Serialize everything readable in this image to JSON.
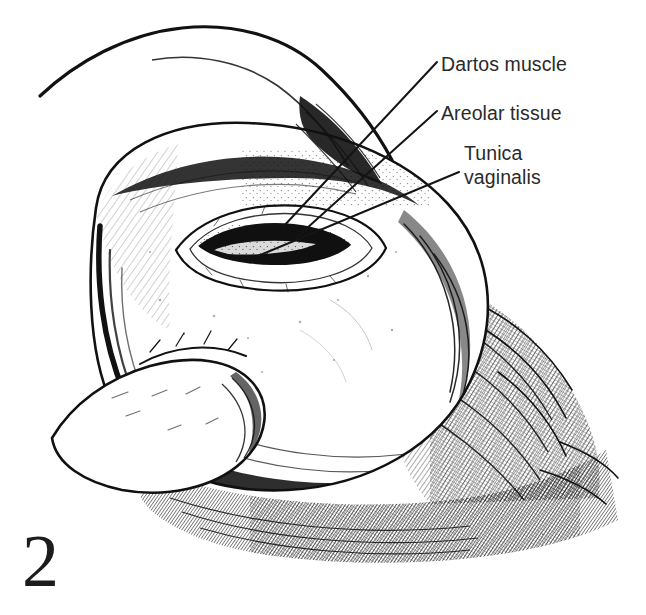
{
  "figure": {
    "number": "2",
    "caption_labels": [
      {
        "id": "dartos-muscle",
        "text": "Dartos muscle",
        "lines": [
          "Dartos muscle"
        ],
        "leader_from": [
          437,
          62
        ],
        "leader_to": [
          282,
          228
        ]
      },
      {
        "id": "areolar-tissue",
        "text": "Areolar tissue",
        "lines": [
          "Areolar tissue"
        ],
        "leader_from": [
          437,
          111
        ],
        "leader_to": [
          296,
          238
        ]
      },
      {
        "id": "tunica-vaginalis",
        "text": "Tunica vaginalis",
        "lines": [
          "Tunica",
          "vaginalis"
        ],
        "leader_from": [
          459,
          172
        ],
        "leader_to": [
          258,
          256
        ]
      }
    ]
  },
  "illustration": {
    "title": "Scrotal incision exposing tunica vaginalis",
    "medium": "pen-and-ink line drawing",
    "subject": "scrotum held in hand with midline incision through dartos muscle",
    "structures": [
      "scrotal skin",
      "dartos muscle",
      "areolar tissue",
      "tunica vaginalis",
      "thumb",
      "incision"
    ]
  },
  "colors": {
    "background": "#ffffff",
    "ink": "#111111",
    "text": "#2a2a2a",
    "figure_number": "#1c1c1c",
    "leader_line": "#141414"
  }
}
